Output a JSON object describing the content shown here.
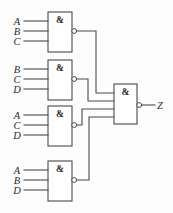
{
  "diagram": {
    "symbol_and": "&",
    "colors": {
      "line": "#4a4a4a",
      "background": "#fdfdfd",
      "text": "#2b2b2b",
      "gate_fill": "#ffffff"
    },
    "gates": [
      {
        "id": "gate-1",
        "type": "nand",
        "symbol": "&",
        "inputs": [
          "A",
          "B",
          "C"
        ],
        "box": {
          "x": 48,
          "y": 12,
          "w": 24,
          "h": 40
        },
        "bubble": {
          "cx": 74.2,
          "cy": 31,
          "r": 2.4
        },
        "input_pins_y": [
          21,
          31,
          41
        ],
        "input_line_start_x": 24,
        "label_x": 17
      },
      {
        "id": "gate-2",
        "type": "nand",
        "symbol": "&",
        "inputs": [
          "B",
          "C",
          "D"
        ],
        "box": {
          "x": 48,
          "y": 60,
          "w": 24,
          "h": 40
        },
        "bubble": {
          "cx": 74.2,
          "cy": 79,
          "r": 2.4
        },
        "input_pins_y": [
          69,
          79,
          89
        ],
        "input_line_start_x": 24,
        "label_x": 17
      },
      {
        "id": "gate-3",
        "type": "nand",
        "symbol": "&",
        "inputs": [
          "A",
          "C",
          "D"
        ],
        "box": {
          "x": 48,
          "y": 106,
          "w": 24,
          "h": 40
        },
        "bubble": {
          "cx": 74.2,
          "cy": 125,
          "r": 2.4
        },
        "input_pins_y": [
          115,
          125,
          135
        ],
        "input_line_start_x": 24,
        "label_x": 17
      },
      {
        "id": "gate-4",
        "type": "nand",
        "symbol": "&",
        "inputs": [
          "A",
          "B",
          "D"
        ],
        "box": {
          "x": 48,
          "y": 161,
          "w": 24,
          "h": 40
        },
        "bubble": {
          "cx": 74.2,
          "cy": 180,
          "r": 2.4
        },
        "input_pins_y": [
          170,
          180,
          190
        ],
        "input_line_start_x": 24,
        "label_x": 17
      },
      {
        "id": "gate-output",
        "type": "nand",
        "symbol": "&",
        "inputs": [],
        "box": {
          "x": 114,
          "y": 84,
          "w": 23,
          "h": 40
        },
        "bubble": {
          "cx": 139.2,
          "cy": 105,
          "r": 2.4
        },
        "input_pins_y": [
          93,
          101,
          109,
          117
        ]
      }
    ],
    "output": {
      "label": "Z",
      "label_x": 158,
      "label_y": 108,
      "wire_from_x": 141.6,
      "wire_to_x": 155,
      "wire_y": 105
    },
    "interconnects": [
      {
        "from_gate": "gate-1",
        "to_pin": 0,
        "via_x": 96
      },
      {
        "from_gate": "gate-2",
        "to_pin": 1,
        "via_x": 88
      },
      {
        "from_gate": "gate-3",
        "to_pin": 2,
        "via_x": 82
      },
      {
        "from_gate": "gate-4",
        "to_pin": 3,
        "via_x": 89
      }
    ]
  }
}
